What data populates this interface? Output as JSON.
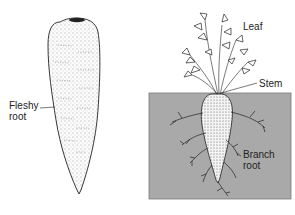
{
  "figure": {
    "left_panel": {
      "labels": {
        "fleshy_root": [
          "Fleshy",
          "root"
        ]
      }
    },
    "right_panel": {
      "labels": {
        "leaf": "Leaf",
        "stem": "Stem",
        "branch_root": [
          "Branch",
          "root"
        ]
      },
      "colors": {
        "soil": "#a9a9a9",
        "soil_border": "#7a7a7a"
      }
    }
  }
}
